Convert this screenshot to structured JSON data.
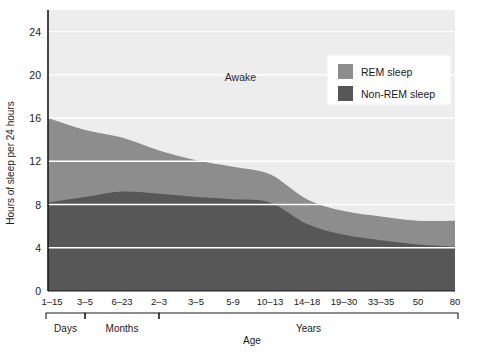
{
  "chart_data": {
    "type": "area",
    "stacked": true,
    "title": "",
    "xlabel": "Age",
    "ylabel": "Hours of sleep per 24 hours",
    "ylim": [
      0,
      26
    ],
    "yticks": [
      0,
      4,
      8,
      12,
      16,
      20,
      24
    ],
    "grid": true,
    "grid_color": "#ffffff",
    "plot_background": "#ededed",
    "legend_position": "top-right",
    "categories": [
      "1–15",
      "3–5",
      "6–23",
      "2–3",
      "3–5",
      "5-9",
      "10–13",
      "14–18",
      "19–30",
      "33–35",
      "50",
      "80"
    ],
    "x_group_labels": [
      "Days",
      "Months",
      "Years"
    ],
    "x_groups": [
      {
        "label": "Days",
        "from": 0,
        "to": 1
      },
      {
        "label": "Months",
        "from": 1,
        "to": 3
      },
      {
        "label": "Years",
        "from": 3,
        "to": 11
      }
    ],
    "series": [
      {
        "name": "Non-REM sleep",
        "color": "#575757",
        "values": [
          8.2,
          8.7,
          9.2,
          9.0,
          8.7,
          8.5,
          8.2,
          6.2,
          5.2,
          4.7,
          4.3,
          4.1
        ]
      },
      {
        "name": "REM sleep",
        "color": "#8d8d8d",
        "values": [
          7.8,
          6.2,
          5.0,
          4.0,
          3.4,
          3.0,
          2.6,
          2.3,
          2.2,
          2.2,
          2.2,
          2.4
        ]
      },
      {
        "name": "Awake",
        "color": "#ededed",
        "values": [
          8.0,
          9.1,
          9.8,
          11.0,
          11.9,
          12.5,
          13.2,
          15.5,
          16.6,
          17.1,
          17.5,
          17.5
        ]
      }
    ],
    "total_sleep": [
      16.0,
      14.9,
      14.2,
      13.0,
      12.1,
      11.5,
      10.8,
      8.5,
      7.4,
      6.9,
      6.5,
      6.5
    ],
    "annotations": [
      {
        "text": "Awake",
        "x_index": 5.2,
        "y_value": 19.4
      }
    ]
  },
  "legend": {
    "items": [
      {
        "label": "REM sleep",
        "color": "#8d8d8d"
      },
      {
        "label": "Non-REM sleep",
        "color": "#575757"
      }
    ]
  }
}
